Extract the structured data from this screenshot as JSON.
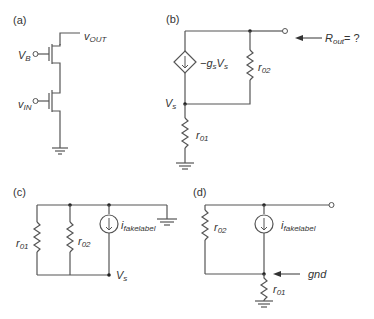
{
  "panels": {
    "a": {
      "label": "(a)",
      "v_b": "V",
      "v_b_sub": "B",
      "v_in": "v",
      "v_in_sub": "IN",
      "v_out": "v",
      "v_out_sub": "OUT"
    },
    "b": {
      "label": "(b)",
      "source": "−g",
      "source_sub": "s",
      "source_v": "V",
      "source_v_sub": "s",
      "r02": "r",
      "r02_sub": "02",
      "r01": "r",
      "r01_sub": "01",
      "vs": "V",
      "vs_sub": "s",
      "rout": "R",
      "rout_sub": "out",
      "rout_suffix": "= ?"
    },
    "c": {
      "label": "(c)",
      "r01": "r",
      "r01_sub": "01",
      "r02": "r",
      "r02_sub": "02",
      "i": "i",
      "i_sub": "fakelabel",
      "vs": "V",
      "vs_sub": "s"
    },
    "d": {
      "label": "(d)",
      "r02": "r",
      "r02_sub": "02",
      "r01": "r",
      "r01_sub": "01",
      "i": "i",
      "i_sub": "fakelabel",
      "gnd": "gnd"
    }
  }
}
